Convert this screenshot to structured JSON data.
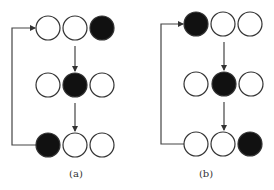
{
  "panels": [
    {
      "id": "a",
      "label": "(a)",
      "label_pos": [
        76,
        168
      ],
      "loop_line_x": 12,
      "rows": [
        {
          "cy": 28,
          "circles": [
            {
              "cx": 48,
              "filled": false
            },
            {
              "cx": 75,
              "filled": false
            },
            {
              "cx": 102,
              "filled": true
            }
          ]
        },
        {
          "cy": 85,
          "circles": [
            {
              "cx": 48,
              "filled": false
            },
            {
              "cx": 75,
              "filled": true
            },
            {
              "cx": 102,
              "filled": false
            }
          ]
        },
        {
          "cy": 145,
          "circles": [
            {
              "cx": 48,
              "filled": true
            },
            {
              "cx": 75,
              "filled": false
            },
            {
              "cx": 102,
              "filled": false
            }
          ]
        }
      ],
      "arrow_x": 75
    },
    {
      "id": "b",
      "label": "(b)",
      "label_pos": [
        206,
        168
      ],
      "loop_line_x": 161,
      "rows": [
        {
          "cy": 24,
          "circles": [
            {
              "cx": 196,
              "filled": true
            },
            {
              "cx": 223,
              "filled": false
            },
            {
              "cx": 250,
              "filled": false
            }
          ]
        },
        {
          "cy": 84,
          "circles": [
            {
              "cx": 196,
              "filled": false
            },
            {
              "cx": 224,
              "filled": true
            },
            {
              "cx": 251,
              "filled": false
            }
          ]
        },
        {
          "cy": 144,
          "circles": [
            {
              "cx": 196,
              "filled": false
            },
            {
              "cx": 223,
              "filled": false
            },
            {
              "cx": 250,
              "filled": true
            }
          ]
        }
      ],
      "arrow_x": 224
    }
  ],
  "circle_radius": 12,
  "colors": {
    "stroke": "#333333",
    "fill": "#111111",
    "empty": "#ffffff",
    "line": "#444444"
  }
}
